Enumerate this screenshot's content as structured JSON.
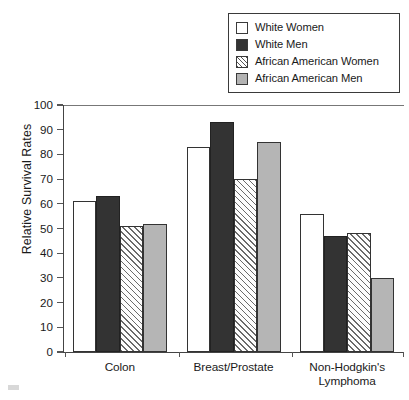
{
  "chart_data": {
    "type": "bar",
    "title": "",
    "subtitle": "",
    "xlabel": "",
    "ylabel": "Relative Survival Rates",
    "ylim": [
      0,
      100
    ],
    "ytick_labels": [
      "100",
      "90",
      "80",
      "70",
      "60",
      "50",
      "40",
      "30",
      "20",
      "10",
      "0"
    ],
    "ytick_values": [
      100,
      90,
      80,
      70,
      60,
      50,
      40,
      30,
      20,
      10,
      0
    ],
    "grid": false,
    "legend_position": "top-right",
    "categories": [
      "Colon",
      "Breast/Prostate",
      "Non-Hodgkin's Lymphoma"
    ],
    "category_lines": [
      [
        "Colon"
      ],
      [
        "Breast/Prostate"
      ],
      [
        "Non-Hodgkin's",
        "Lymphoma"
      ]
    ],
    "series": [
      {
        "name": "White Women",
        "fill": "white",
        "color": "#ffffff",
        "values": [
          61,
          83,
          56
        ]
      },
      {
        "name": "White Men",
        "fill": "solid-black",
        "color": "#333333",
        "values": [
          63,
          93,
          47
        ]
      },
      {
        "name": "African American Women",
        "fill": "diagonal-hatch",
        "color": "#ffffff",
        "values": [
          51,
          70,
          48
        ]
      },
      {
        "name": "African American Men",
        "fill": "solid-gray",
        "color": "#b5b5b5",
        "values": [
          52,
          85,
          30
        ]
      }
    ]
  },
  "legend": {
    "items": [
      {
        "label": "White Women",
        "swatch": "swatch-white"
      },
      {
        "label": "White Men",
        "swatch": "swatch-black"
      },
      {
        "label": "African American Women",
        "swatch": "swatch-hatched"
      },
      {
        "label": "African American Men",
        "swatch": "swatch-gray"
      }
    ]
  },
  "axis": {
    "y_title": "Relative Survival Rates"
  }
}
